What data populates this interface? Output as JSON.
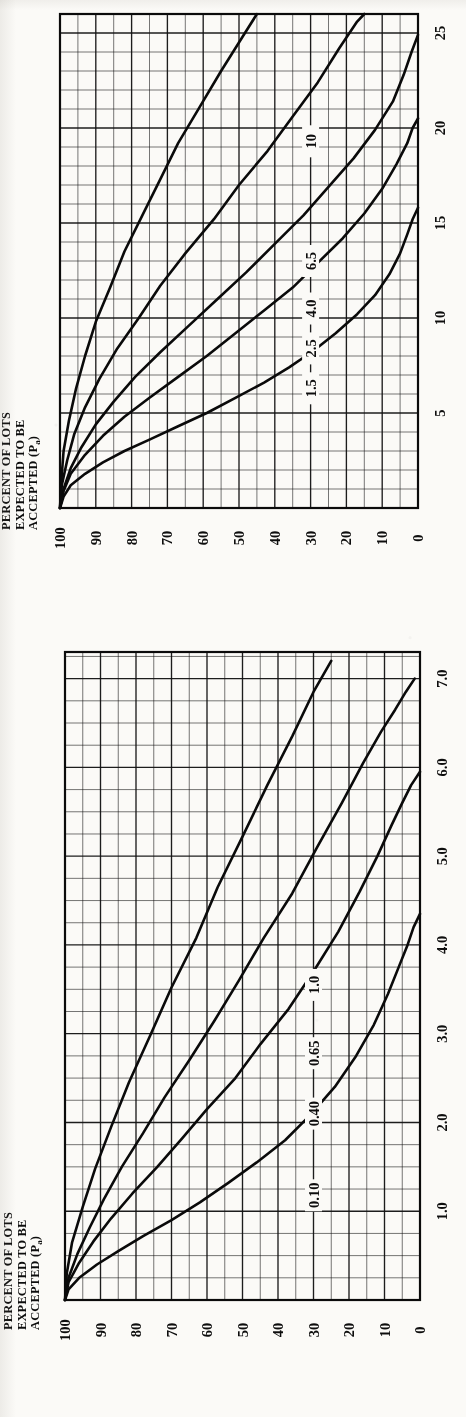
{
  "page": {
    "background_color": "#fbfaf7",
    "ink_color": "#101010",
    "orientation": "rotated-90-ccw"
  },
  "axis_title": {
    "line1": "PERCENT OF LOTS",
    "line2": "EXPECTED TO BE",
    "line3": "ACCEPTED (P",
    "subscript": "a",
    "line3_end": ")"
  },
  "chart_data": [
    {
      "id": "top-chart",
      "type": "line",
      "title": "",
      "xlabel": "",
      "ylabel": "PERCENT OF LOTS EXPECTED TO BE ACCEPTED (Pa)",
      "xlim": [
        0,
        26
      ],
      "ylim": [
        0,
        100
      ],
      "xticks": [
        5,
        10,
        15,
        20,
        25
      ],
      "yticks": [
        100,
        90,
        80,
        70,
        60,
        50,
        40,
        30,
        20,
        10,
        0
      ],
      "grid": true,
      "grid_minor_x": 1,
      "grid_minor_y": 5,
      "legend_position": "inline-curve-labels",
      "series": [
        {
          "name": "1.5",
          "label": "1.5",
          "label_x": 6.3,
          "label_y": 30,
          "points": [
            [
              0,
              100
            ],
            [
              0.6,
              99
            ],
            [
              1.2,
              97
            ],
            [
              1.8,
              93
            ],
            [
              2.4,
              88
            ],
            [
              3.0,
              82
            ],
            [
              3.6,
              75
            ],
            [
              4.3,
              67
            ],
            [
              5.0,
              59
            ],
            [
              5.8,
              51
            ],
            [
              6.6,
              43
            ],
            [
              7.4,
              36
            ],
            [
              8.3,
              29
            ],
            [
              9.2,
              23
            ],
            [
              10.2,
              17
            ],
            [
              11.2,
              12
            ],
            [
              12.3,
              8
            ],
            [
              13.4,
              5
            ],
            [
              14.4,
              3
            ],
            [
              15.2,
              1.5
            ],
            [
              15.8,
              0
            ]
          ]
        },
        {
          "name": "2.5",
          "label": "2.5",
          "label_x": 8.4,
          "label_y": 30,
          "points": [
            [
              0,
              100
            ],
            [
              0.9,
              99
            ],
            [
              1.8,
              97
            ],
            [
              2.8,
              93
            ],
            [
              3.8,
              88
            ],
            [
              4.8,
              82
            ],
            [
              5.8,
              75
            ],
            [
              6.9,
              67
            ],
            [
              8.0,
              59
            ],
            [
              9.2,
              51
            ],
            [
              10.4,
              43
            ],
            [
              11.6,
              35
            ],
            [
              12.9,
              28
            ],
            [
              14.2,
              21
            ],
            [
              15.5,
              15
            ],
            [
              16.8,
              10
            ],
            [
              18.1,
              6
            ],
            [
              19.2,
              3
            ],
            [
              20.0,
              1.5
            ],
            [
              20.5,
              0
            ]
          ]
        },
        {
          "name": "4.0",
          "label": "4.0",
          "label_x": 10.5,
          "label_y": 30,
          "points": [
            [
              0,
              100
            ],
            [
              1.0,
              99
            ],
            [
              2.1,
              97
            ],
            [
              3.2,
              94
            ],
            [
              4.4,
              90
            ],
            [
              5.6,
              85
            ],
            [
              6.9,
              79
            ],
            [
              8.2,
              72
            ],
            [
              9.6,
              64
            ],
            [
              11.0,
              56
            ],
            [
              12.4,
              48
            ],
            [
              13.9,
              40
            ],
            [
              15.4,
              32
            ],
            [
              16.9,
              25
            ],
            [
              18.4,
              18
            ],
            [
              19.9,
              12
            ],
            [
              21.4,
              7
            ],
            [
              22.8,
              4
            ],
            [
              24.0,
              1.8
            ],
            [
              24.9,
              0
            ]
          ]
        },
        {
          "name": "6.5",
          "label": "6.5",
          "label_x": 13.0,
          "label_y": 30,
          "points": [
            [
              0,
              100
            ],
            [
              1.2,
              99.5
            ],
            [
              2.5,
              98
            ],
            [
              3.9,
              96
            ],
            [
              5.3,
              93
            ],
            [
              6.8,
              89
            ],
            [
              8.4,
              84
            ],
            [
              10.0,
              78
            ],
            [
              11.7,
              72
            ],
            [
              13.4,
              65
            ],
            [
              15.2,
              57
            ],
            [
              17.0,
              50
            ],
            [
              18.8,
              42
            ],
            [
              20.6,
              35
            ],
            [
              22.4,
              28
            ],
            [
              24.2,
              22
            ],
            [
              25.6,
              17
            ],
            [
              26.0,
              15
            ]
          ]
        },
        {
          "name": "10",
          "label": "10",
          "label_x": 19.3,
          "label_y": 30,
          "points": [
            [
              0,
              100
            ],
            [
              1.5,
              99.6
            ],
            [
              3.0,
              99
            ],
            [
              4.6,
              97.5
            ],
            [
              6.3,
              95.5
            ],
            [
              8.0,
              93
            ],
            [
              9.8,
              90
            ],
            [
              11.6,
              86
            ],
            [
              13.5,
              82
            ],
            [
              15.4,
              77
            ],
            [
              17.3,
              72
            ],
            [
              19.2,
              67
            ],
            [
              21.1,
              61
            ],
            [
              23.0,
              55
            ],
            [
              24.8,
              49
            ],
            [
              26.0,
              45
            ]
          ]
        }
      ]
    },
    {
      "id": "bottom-chart",
      "type": "line",
      "title": "",
      "xlabel": "",
      "ylabel": "PERCENT OF LOTS EXPECTED TO BE ACCEPTED (Pa)",
      "xlim": [
        0,
        7.3
      ],
      "ylim": [
        0,
        100
      ],
      "xticks": [
        1.0,
        2.0,
        3.0,
        4.0,
        5.0,
        6.0,
        7.0
      ],
      "xticklabels": [
        "1.0",
        "2.0",
        "3.0",
        "4.0",
        "5.0",
        "6.0",
        "7.0"
      ],
      "yticks": [
        100,
        90,
        80,
        70,
        60,
        50,
        40,
        30,
        20,
        10,
        0
      ],
      "grid": true,
      "grid_minor_x": 0.25,
      "grid_minor_y": 5,
      "legend_position": "inline-curve-labels",
      "series": [
        {
          "name": "0.10",
          "label": "0.10",
          "label_x": 1.18,
          "label_y": 30,
          "points": [
            [
              0,
              100
            ],
            [
              0.12,
              99
            ],
            [
              0.25,
              96
            ],
            [
              0.4,
              91
            ],
            [
              0.55,
              85
            ],
            [
              0.72,
              78
            ],
            [
              0.9,
              70
            ],
            [
              1.1,
              62
            ],
            [
              1.32,
              54
            ],
            [
              1.55,
              46
            ],
            [
              1.8,
              38
            ],
            [
              2.08,
              31
            ],
            [
              2.4,
              24
            ],
            [
              2.75,
              18
            ],
            [
              3.1,
              13
            ],
            [
              3.45,
              9
            ],
            [
              3.75,
              6
            ],
            [
              4.0,
              3.5
            ],
            [
              4.2,
              1.8
            ],
            [
              4.35,
              0
            ]
          ]
        },
        {
          "name": "0.40",
          "label": "0.40",
          "label_x": 2.1,
          "label_y": 30,
          "points": [
            [
              0,
              100
            ],
            [
              0.2,
              99
            ],
            [
              0.42,
              96
            ],
            [
              0.66,
              92
            ],
            [
              0.92,
              87
            ],
            [
              1.2,
              81
            ],
            [
              1.5,
              74
            ],
            [
              1.82,
              67
            ],
            [
              2.15,
              60
            ],
            [
              2.5,
              52
            ],
            [
              2.88,
              45
            ],
            [
              3.28,
              37
            ],
            [
              3.7,
              30
            ],
            [
              4.15,
              23
            ],
            [
              4.6,
              17
            ],
            [
              5.0,
              12
            ],
            [
              5.35,
              8
            ],
            [
              5.6,
              5
            ],
            [
              5.8,
              2.5
            ],
            [
              5.95,
              0
            ]
          ]
        },
        {
          "name": "0.65",
          "label": "0.65",
          "label_x": 2.78,
          "label_y": 30,
          "points": [
            [
              0,
              100
            ],
            [
              0.25,
              99
            ],
            [
              0.52,
              96.5
            ],
            [
              0.82,
              93
            ],
            [
              1.14,
              89
            ],
            [
              1.5,
              84
            ],
            [
              1.88,
              78
            ],
            [
              2.28,
              72
            ],
            [
              2.7,
              65
            ],
            [
              3.14,
              58
            ],
            [
              3.6,
              51
            ],
            [
              4.08,
              44
            ],
            [
              4.58,
              36
            ],
            [
              5.1,
              29
            ],
            [
              5.6,
              22
            ],
            [
              6.05,
              16
            ],
            [
              6.4,
              11
            ],
            [
              6.65,
              7
            ],
            [
              6.85,
              4
            ],
            [
              7.0,
              1.5
            ]
          ]
        },
        {
          "name": "1.0",
          "label": "1.0",
          "label_x": 3.55,
          "label_y": 30,
          "points": [
            [
              0,
              100
            ],
            [
              0.3,
              99.5
            ],
            [
              0.65,
              98
            ],
            [
              1.05,
              95
            ],
            [
              1.48,
              91.5
            ],
            [
              1.95,
              87
            ],
            [
              2.45,
              82
            ],
            [
              2.98,
              76
            ],
            [
              3.52,
              70
            ],
            [
              4.08,
              63
            ],
            [
              4.65,
              57
            ],
            [
              5.22,
              50
            ],
            [
              5.8,
              43
            ],
            [
              6.35,
              36
            ],
            [
              6.85,
              30
            ],
            [
              7.2,
              25
            ]
          ]
        }
      ]
    }
  ]
}
